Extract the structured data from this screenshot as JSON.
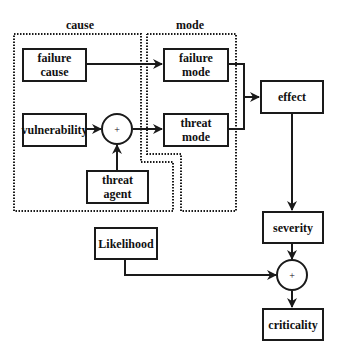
{
  "diagram": {
    "groups": {
      "cause": {
        "label": "cause"
      },
      "mode": {
        "label": "mode"
      }
    },
    "nodes": {
      "failure_cause": {
        "line1": "failure",
        "line2": "cause"
      },
      "vulnerability": {
        "label": "vulnerability"
      },
      "threat_agent": {
        "line1": "threat",
        "line2": "agent"
      },
      "failure_mode": {
        "line1": "failure",
        "line2": "mode"
      },
      "threat_mode": {
        "line1": "threat",
        "line2": "mode"
      },
      "effect": {
        "label": "effect"
      },
      "severity": {
        "label": "severity"
      },
      "likelihood": {
        "label": "Likelihood"
      },
      "criticality": {
        "label": "criticality"
      }
    },
    "operators": {
      "combine_threat": {
        "symbol": "+"
      },
      "combine_criticality": {
        "symbol": "+"
      }
    },
    "edges": [
      {
        "from": "failure cause",
        "to": "failure mode"
      },
      {
        "from": "vulnerability",
        "to": "+ (threat)"
      },
      {
        "from": "threat agent",
        "to": "+ (threat)"
      },
      {
        "from": "+ (threat)",
        "to": "threat mode"
      },
      {
        "from": "failure mode",
        "to": "effect"
      },
      {
        "from": "threat mode",
        "to": "effect"
      },
      {
        "from": "effect",
        "to": "severity"
      },
      {
        "from": "severity",
        "to": "+ (criticality)"
      },
      {
        "from": "Likelihood",
        "to": "+ (criticality)"
      },
      {
        "from": "+ (criticality)",
        "to": "criticality"
      }
    ]
  }
}
